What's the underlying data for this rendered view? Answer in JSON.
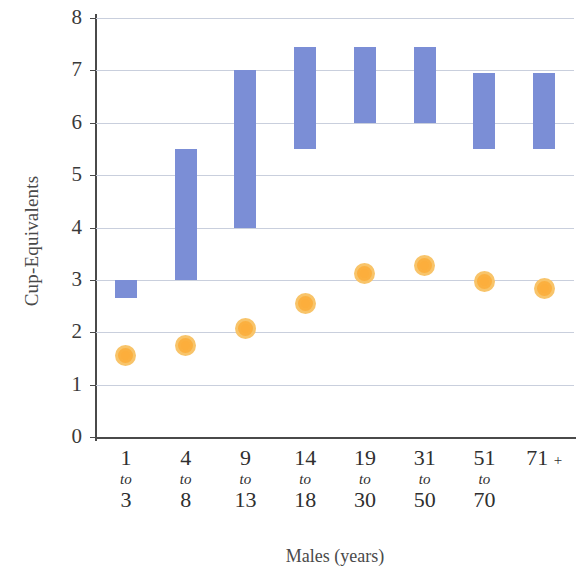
{
  "chart_data": {
    "type": "bar",
    "title": "",
    "subtitle": "",
    "xlabel": "Males (years)",
    "ylabel": "Cup-Equivalents",
    "categories": [
      "1 to 3",
      "4 to 8",
      "9 to 13",
      "14 to 18",
      "19 to 30",
      "31 to 50",
      "51 to 70",
      "71 +"
    ],
    "category_lines": [
      {
        "top": "1",
        "mid": "to",
        "bottom": "3"
      },
      {
        "top": "4",
        "mid": "to",
        "bottom": "8"
      },
      {
        "top": "9",
        "mid": "to",
        "bottom": "13"
      },
      {
        "top": "14",
        "mid": "to",
        "bottom": "18"
      },
      {
        "top": "19",
        "mid": "to",
        "bottom": "30"
      },
      {
        "top": "31",
        "mid": "to",
        "bottom": "50"
      },
      {
        "top": "51",
        "mid": "to",
        "bottom": "70"
      },
      {
        "top": "71",
        "mid": "+",
        "bottom": ""
      }
    ],
    "ylim": [
      0,
      8
    ],
    "yticks": [
      0,
      1,
      2,
      3,
      4,
      5,
      6,
      7,
      8
    ],
    "ytick_labels": [
      "0",
      "1",
      "2",
      "3",
      "4",
      "5",
      "6",
      "7",
      "8"
    ],
    "grid": true,
    "grid_axis": "y",
    "legend": "none",
    "series": [
      {
        "name": "Recommended intake range",
        "type": "range-bar",
        "color": "#7b8ed6",
        "low": [
          2.65,
          3.0,
          4.0,
          5.5,
          6.0,
          6.0,
          5.5,
          5.5
        ],
        "high": [
          3.0,
          5.5,
          7.0,
          7.45,
          7.45,
          7.45,
          6.95,
          6.95
        ]
      },
      {
        "name": "Average intake",
        "type": "marker",
        "color": "#fbb040",
        "edge_color": "#f8c46a",
        "values": [
          1.55,
          1.75,
          2.08,
          2.55,
          3.12,
          3.27,
          2.97,
          2.83
        ]
      }
    ]
  },
  "colors": {
    "bar": "#7b8ed6",
    "marker_fill": "#fbb040",
    "marker_ring": "#f8c46a",
    "gridline": "#c9cfdd",
    "axis": "#4a4a4a",
    "text": "#3a3a3a",
    "background": "#ffffff"
  }
}
